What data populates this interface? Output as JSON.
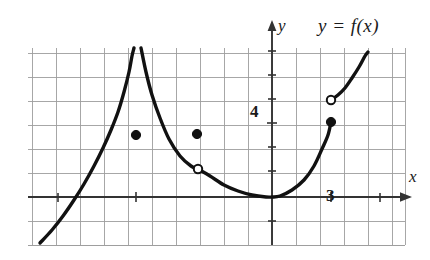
{
  "figure": {
    "title_label": "y = f(x)",
    "axis_labels": {
      "x": "x",
      "y": "y"
    },
    "tick_labels": {
      "y_four": "4",
      "x_three": "3"
    }
  },
  "chart_data": {
    "type": "line",
    "title": "y = f(x)",
    "xlabel": "x",
    "ylabel": "y",
    "grid": true,
    "legend": "none",
    "annotations": [
      "y = f(x)",
      "4",
      "3"
    ],
    "axis_ranges": {
      "x_pixels": [
        28,
        405
      ],
      "y_pixels": [
        48,
        245
      ],
      "origin_pixels": [
        272,
        197
      ],
      "cell_size_pixels": 24
    },
    "tick_values": {
      "y": [
        4
      ],
      "x": [
        3
      ]
    },
    "features": {
      "vertical_asymptote_x_pixels": 136,
      "minimum_point_pixels": [
        272,
        196
      ],
      "closed_points_pixels": [
        [
          136,
          135
        ],
        [
          197,
          134
        ],
        [
          331,
          122
        ]
      ],
      "open_points_pixels": [
        [
          198,
          169
        ],
        [
          331,
          100
        ]
      ]
    },
    "series": [
      {
        "name": "left-branch",
        "kind": "curve",
        "points_pixels": [
          [
            40,
            243
          ],
          [
            52,
            230
          ],
          [
            63,
            216
          ],
          [
            74,
            200
          ],
          [
            84,
            184
          ],
          [
            94,
            166
          ],
          [
            103,
            148
          ],
          [
            111,
            130
          ],
          [
            118,
            112
          ],
          [
            124,
            92
          ],
          [
            129,
            72
          ],
          [
            132,
            56
          ],
          [
            134,
            48
          ]
        ]
      },
      {
        "name": "middle-branch",
        "kind": "curve",
        "points_pixels": [
          [
            141,
            48
          ],
          [
            146,
            72
          ],
          [
            152,
            95
          ],
          [
            160,
            118
          ],
          [
            169,
            139
          ],
          [
            180,
            156
          ],
          [
            191,
            166
          ],
          [
            198,
            169
          ],
          [
            210,
            176
          ],
          [
            224,
            185
          ],
          [
            238,
            191
          ],
          [
            252,
            195
          ],
          [
            266,
            197
          ],
          [
            272,
            197
          ],
          [
            280,
            196
          ],
          [
            292,
            190
          ],
          [
            304,
            180
          ],
          [
            314,
            166
          ],
          [
            322,
            149
          ],
          [
            328,
            135
          ],
          [
            331,
            122
          ]
        ]
      },
      {
        "name": "right-branch",
        "kind": "curve",
        "points_pixels": [
          [
            331,
            100
          ],
          [
            338,
            95
          ],
          [
            345,
            88
          ],
          [
            352,
            78
          ],
          [
            359,
            67
          ],
          [
            365,
            56
          ],
          [
            368,
            52
          ]
        ]
      }
    ],
    "colors": {
      "curve": "#111111",
      "axis": "#3a3a3a",
      "grid": "#9a9a9a",
      "background": "#ffffff"
    }
  }
}
